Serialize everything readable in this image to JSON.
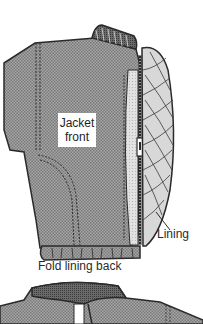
{
  "figure": {
    "top_illustration": {
      "labels": {
        "jacket_front_line1": "Jacket",
        "jacket_front_line2": "front",
        "lining": "Lining"
      }
    },
    "caption": "Fold lining back",
    "colors": {
      "jacket_fill": "#9a9a9a",
      "lining_fill": "#d8d8d8",
      "fleece_fill": "#e8e8e8",
      "outline": "#2a2a2a",
      "background": "#ffffff"
    }
  }
}
